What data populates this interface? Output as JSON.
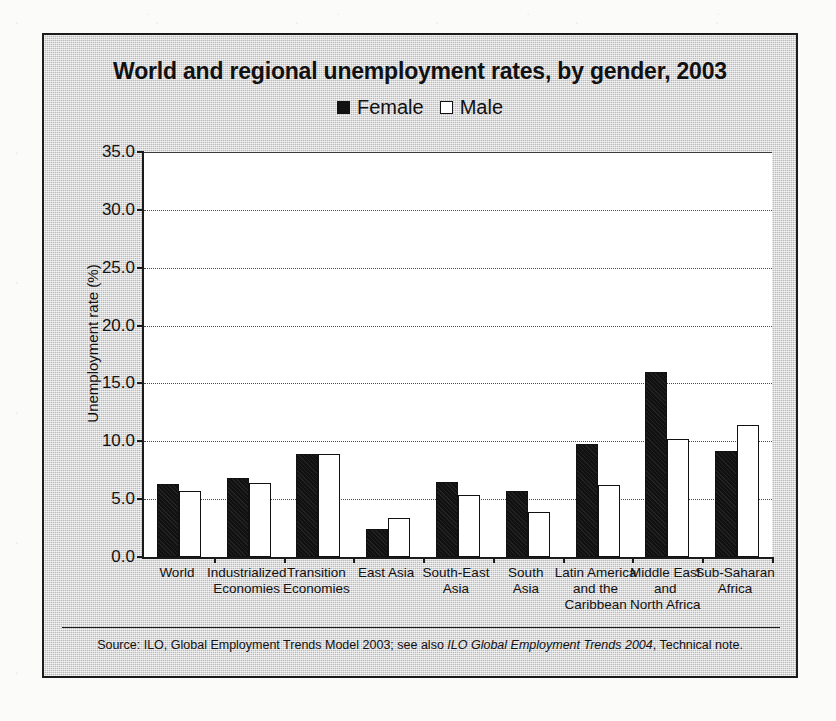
{
  "figure": {
    "title": "World and regional unemployment rates, by gender, 2003",
    "source_prefix": "Source: ILO, Global Employment Trends Model 2003; see also ",
    "source_italic": "ILO Global Employment Trends 2004",
    "source_suffix": ", Technical note."
  },
  "legend": {
    "position": "top-center",
    "entries": [
      {
        "label": "Female",
        "marker": "filled-square",
        "color": "#111111"
      },
      {
        "label": "Male",
        "marker": "open-square",
        "color": "#ffffff"
      }
    ]
  },
  "chart_data": {
    "type": "bar",
    "title": "World and regional unemployment rates, by gender, 2003",
    "xlabel": "",
    "ylabel": "Unemployment rate (%)",
    "ylim": [
      0.0,
      35.0
    ],
    "ytick_step": 5.0,
    "ytick_labels": [
      "0.0",
      "5.0",
      "10.0",
      "15.0",
      "20.0",
      "25.0",
      "30.0",
      "35.0"
    ],
    "ytick_values": [
      0.0,
      5.0,
      10.0,
      15.0,
      20.0,
      25.0,
      30.0,
      35.0
    ],
    "grid": true,
    "categories": [
      "World",
      "Industrialized Economies",
      "Transition Economies",
      "East Asia",
      "South-East Asia",
      "South Asia",
      "Latin America and the Caribbean",
      "Middle East and North Africa",
      "Sub-Saharan Africa"
    ],
    "category_lines": [
      [
        "World"
      ],
      [
        "Industrialized",
        "Economies"
      ],
      [
        "Transition",
        "Economies"
      ],
      [
        "East Asia"
      ],
      [
        "South-East",
        "Asia"
      ],
      [
        "South",
        "Asia"
      ],
      [
        "Latin America",
        "and the",
        "Caribbean"
      ],
      [
        "Middle East",
        "and",
        "North Africa"
      ],
      [
        "Sub-Saharan",
        "Africa"
      ]
    ],
    "series": [
      {
        "name": "Female",
        "values": [
          6.3,
          6.8,
          8.9,
          2.4,
          6.5,
          5.7,
          9.8,
          16.0,
          9.2
        ]
      },
      {
        "name": "Male",
        "values": [
          5.7,
          6.4,
          8.9,
          3.4,
          5.4,
          3.9,
          6.2,
          10.2,
          11.4
        ]
      }
    ]
  }
}
